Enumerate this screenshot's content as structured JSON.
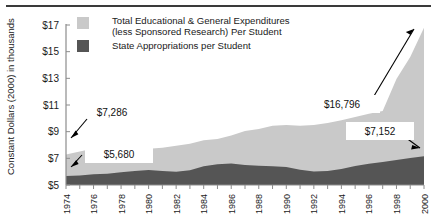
{
  "figure": {
    "name": "educational-expenditures-area-chart"
  },
  "chart_data": {
    "type": "area",
    "stacked": true,
    "title": "",
    "subtitle": "",
    "xlabel": "",
    "ylabel": "Constant Dollars (2000) in thousands",
    "xlim": [
      1974,
      2000
    ],
    "ylim": [
      5,
      17
    ],
    "grid": false,
    "legend_position": "top-center",
    "y_ticks": [
      "$5",
      "$7",
      "$9",
      "$11",
      "$13",
      "$15",
      "$17"
    ],
    "y_tick_values": [
      5,
      7,
      9,
      11,
      13,
      15,
      17
    ],
    "x_ticks": [
      "1974",
      "1976",
      "1978",
      "1980",
      "1982",
      "1984",
      "1986",
      "1988",
      "1990",
      "1992",
      "1994",
      "1996",
      "1998",
      "2000"
    ],
    "x_tick_values": [
      1974,
      1976,
      1978,
      1980,
      1982,
      1984,
      1986,
      1988,
      1990,
      1992,
      1994,
      1996,
      1998,
      2000
    ],
    "x": [
      1974,
      1975,
      1976,
      1977,
      1978,
      1979,
      1980,
      1981,
      1982,
      1983,
      1984,
      1985,
      1986,
      1987,
      1988,
      1989,
      1990,
      1991,
      1992,
      1993,
      1994,
      1995,
      1996,
      1997,
      1998,
      1999,
      2000
    ],
    "series": [
      {
        "name": "Total Educational & General Expenditures (less Sponsored Research) Per Student",
        "color": "#c9c9c9",
        "values": [
          7.286,
          7.52,
          7.73,
          7.62,
          7.58,
          7.6,
          7.72,
          7.8,
          7.95,
          8.1,
          8.35,
          8.45,
          8.72,
          9.05,
          9.2,
          9.45,
          9.5,
          9.45,
          9.5,
          9.65,
          9.85,
          10.1,
          10.35,
          10.55,
          12.95,
          14.6,
          16.796
        ]
      },
      {
        "name": "State Appropriations per Student",
        "color": "#555555",
        "values": [
          5.68,
          5.72,
          5.8,
          5.85,
          5.95,
          6.05,
          6.12,
          6.05,
          6.0,
          6.1,
          6.4,
          6.55,
          6.62,
          6.5,
          6.45,
          6.4,
          6.35,
          6.15,
          6.02,
          6.05,
          6.2,
          6.42,
          6.6,
          6.72,
          6.88,
          7.02,
          7.152
        ]
      }
    ],
    "annotations": [
      {
        "name": "callout-total-1974",
        "label": "$7,286",
        "style": "plain",
        "points_to_series": "Total Educational & General Expenditures (less Sponsored Research) Per Student",
        "points_to_year": 1974,
        "value": 7.286
      },
      {
        "name": "callout-state-1974",
        "label": "$5,680",
        "style": "boxed",
        "points_to_series": "State Appropriations per Student",
        "points_to_year": 1974,
        "value": 5.68
      },
      {
        "name": "callout-total-2000",
        "label": "$16,796",
        "style": "boxed",
        "points_to_series": "Total Educational & General Expenditures (less Sponsored Research) Per Student",
        "points_to_year": 2000,
        "value": 16.796
      },
      {
        "name": "callout-state-2000",
        "label": "$7,152",
        "style": "boxed",
        "points_to_series": "State Appropriations per Student",
        "points_to_year": 2000,
        "value": 7.152
      }
    ],
    "legend": [
      {
        "label_line1": "Total Educational & General Expenditures",
        "label_line2": "(less Sponsored Research) Per Student",
        "color": "#c9c9c9"
      },
      {
        "label_line1": "State Appropriations per Student",
        "label_line2": "",
        "color": "#555555"
      }
    ]
  }
}
